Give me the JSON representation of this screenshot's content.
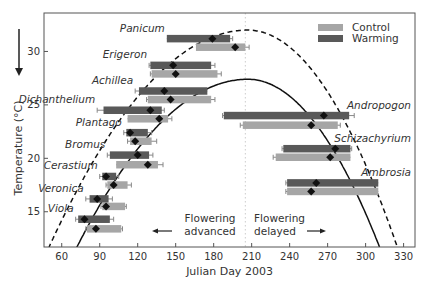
{
  "chart_data": {
    "type": "bar",
    "subtype": "horizontal-range-bars-with-means-and-error-bars",
    "title": "",
    "xlabel": "Julian Day 2003",
    "ylabel": "Temperature (°C)",
    "xlim": [
      46,
      339
    ],
    "ylim": [
      11.7,
      33.6
    ],
    "xticks": [
      60,
      90,
      120,
      150,
      180,
      210,
      240,
      270,
      300,
      330
    ],
    "yticks": [
      15,
      20,
      25,
      30
    ],
    "grid": false,
    "legend": {
      "position": "upper right",
      "entries": [
        {
          "label": "Control",
          "color": "#a6a6a6"
        },
        {
          "label": "Warming",
          "color": "#595959"
        }
      ]
    },
    "reference_line": {
      "x": 205,
      "style": "dotted",
      "color": "#cccccc"
    },
    "annotations": [
      {
        "text_lines": [
          "Flowering",
          "advanced"
        ],
        "arrow": "left",
        "x": 150,
        "y": 14.0
      },
      {
        "text_lines": [
          "Flowering",
          "delayed"
        ],
        "arrow": "right",
        "x": 215,
        "y": 14.0
      }
    ],
    "curves": [
      {
        "name": "Warming envelope",
        "style": "dashed",
        "peak_day": 207,
        "peak_temp": 32.0,
        "x_at_bottom": [
          50,
          325
        ]
      },
      {
        "name": "Control envelope",
        "style": "solid",
        "peak_day": 207,
        "peak_temp": 27.4,
        "x_at_bottom": [
          72,
          311
        ]
      }
    ],
    "species": [
      {
        "name": "Panicum",
        "label_pos": "left",
        "warming": {
          "temp": 31.2,
          "start": 143,
          "end": 193,
          "mean": 179,
          "err_left": 0,
          "err_right": 2
        },
        "control": {
          "temp": 30.4,
          "start": 166,
          "end": 205,
          "mean": 197,
          "err_left": 0,
          "err_right": 3
        }
      },
      {
        "name": "Erigeron",
        "label_pos": "left",
        "warming": {
          "temp": 28.7,
          "start": 130,
          "end": 178,
          "mean": 148,
          "err_left": 1,
          "err_right": 3
        },
        "control": {
          "temp": 27.9,
          "start": 131,
          "end": 183,
          "mean": 150,
          "err_left": 1,
          "err_right": 3
        }
      },
      {
        "name": "Achillea",
        "label_pos": "left",
        "warming": {
          "temp": 26.3,
          "start": 121,
          "end": 175,
          "mean": 141,
          "err_left": 3,
          "err_right": 0
        },
        "control": {
          "temp": 25.5,
          "start": 128,
          "end": 178,
          "mean": 146,
          "err_left": 1,
          "err_right": 3
        }
      },
      {
        "name": "Dichanthelium",
        "label_pos": "left",
        "warming": {
          "temp": 24.5,
          "start": 93,
          "end": 139,
          "mean": 130,
          "err_left": 5,
          "err_right": 2
        },
        "control": {
          "temp": 23.7,
          "start": 112,
          "end": 144,
          "mean": 137,
          "err_left": 0,
          "err_right": 3
        }
      },
      {
        "name": "Plantago",
        "label_pos": "left",
        "warming": {
          "temp": 22.4,
          "start": 111,
          "end": 128,
          "mean": 114,
          "err_left": 2,
          "err_right": 3
        },
        "control": {
          "temp": 21.6,
          "start": 114,
          "end": 131,
          "mean": 118,
          "err_left": 2,
          "err_right": 4
        }
      },
      {
        "name": "Bromus",
        "label_pos": "left",
        "warming": {
          "temp": 20.3,
          "start": 98,
          "end": 129,
          "mean": 120,
          "err_left": 2,
          "err_right": 3
        },
        "control": {
          "temp": 19.4,
          "start": 103,
          "end": 136,
          "mean": 128,
          "err_left": 0,
          "err_right": 4
        }
      },
      {
        "name": "Cerastium",
        "label_pos": "left",
        "warming": {
          "temp": 18.3,
          "start": 92,
          "end": 103,
          "mean": 95,
          "err_left": 2,
          "err_right": 2
        },
        "control": {
          "temp": 17.5,
          "start": 96,
          "end": 112,
          "mean": 101,
          "err_left": 1,
          "err_right": 3
        }
      },
      {
        "name": "Veronica",
        "label_pos": "left",
        "warming": {
          "temp": 16.2,
          "start": 82,
          "end": 97,
          "mean": 88,
          "err_left": 3,
          "err_right": 3
        },
        "control": {
          "temp": 15.5,
          "start": 92,
          "end": 110,
          "mean": 95,
          "err_left": 1,
          "err_right": 1
        }
      },
      {
        "name": "Viola",
        "label_pos": "left",
        "warming": {
          "temp": 14.3,
          "start": 73,
          "end": 98,
          "mean": 78,
          "err_left": 2,
          "err_right": 3
        },
        "control": {
          "temp": 13.4,
          "start": 80,
          "end": 107,
          "mean": 87,
          "err_left": 1,
          "err_right": 1
        }
      },
      {
        "name": "Andropogon",
        "label_pos": "right",
        "warming": {
          "temp": 24.0,
          "start": 188,
          "end": 287,
          "mean": 267,
          "err_left": 1,
          "err_right": 4
        },
        "control": {
          "temp": 23.1,
          "start": 203,
          "end": 278,
          "mean": 257,
          "err_left": 2,
          "err_right": 2
        }
      },
      {
        "name": "Schizachyrium",
        "label_pos": "right",
        "warming": {
          "temp": 20.9,
          "start": 235,
          "end": 288,
          "mean": 276,
          "err_left": 1,
          "err_right": 1
        },
        "control": {
          "temp": 20.1,
          "start": 229,
          "end": 288,
          "mean": 272,
          "err_left": 2,
          "err_right": 0
        }
      },
      {
        "name": "Ambrosia",
        "label_pos": "right",
        "warming": {
          "temp": 17.7,
          "start": 238,
          "end": 310,
          "mean": 261,
          "err_left": 1,
          "err_right": 0
        },
        "control": {
          "temp": 16.9,
          "start": 238,
          "end": 310,
          "mean": 257,
          "err_left": 1,
          "err_right": 0
        }
      }
    ]
  },
  "colors": {
    "control": "#a6a6a6",
    "warming": "#595959",
    "axis": "#555555",
    "text": "#333333",
    "diamond": "#111111",
    "curve": "#111111",
    "refline": "#cccccc"
  },
  "legend_labels": {
    "control": "Control",
    "warming": "Warming"
  }
}
